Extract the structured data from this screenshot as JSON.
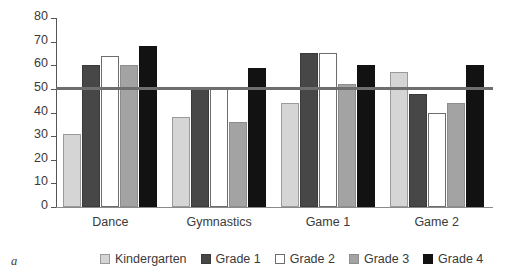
{
  "figure": {
    "panel_label": "a"
  },
  "chart_data": {
    "type": "bar",
    "title": "",
    "xlabel": "",
    "ylabel": "",
    "ylim": [
      0,
      80
    ],
    "yticks": [
      0,
      10,
      20,
      30,
      40,
      50,
      60,
      70,
      80
    ],
    "ytick_labels": [
      "0",
      "10",
      "20",
      "30",
      "40",
      "50",
      "60",
      "70",
      "80"
    ],
    "grid": false,
    "legend_position": "bottom",
    "reference_line": {
      "value": 50,
      "orientation": "horizontal",
      "color": "#6e6e6e"
    },
    "categories": [
      "Dance",
      "Gymnastics",
      "Game 1",
      "Game 2"
    ],
    "series": [
      {
        "name": "Kindergarten",
        "color": "#d5d5d5",
        "edge": "#9a9a9a",
        "values": [
          31,
          38,
          44,
          57
        ]
      },
      {
        "name": "Grade 1",
        "color": "#474747",
        "edge": "#3a3a3a",
        "values": [
          60,
          50,
          65,
          48
        ]
      },
      {
        "name": "Grade 2",
        "color": "#ffffff",
        "edge": "#6d6d6d",
        "values": [
          64,
          50,
          65,
          40
        ]
      },
      {
        "name": "Grade 3",
        "color": "#a3a3a3",
        "edge": "#8d8d8d",
        "values": [
          60,
          36,
          52,
          44
        ]
      },
      {
        "name": "Grade 4",
        "color": "#121212",
        "edge": "#121212",
        "values": [
          68,
          59,
          60,
          60
        ]
      }
    ]
  }
}
